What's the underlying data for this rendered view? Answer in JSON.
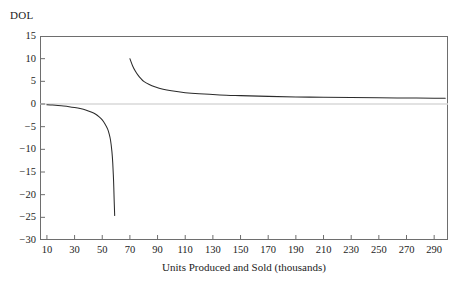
{
  "chart_data": {
    "type": "line",
    "title": "",
    "ylabel": "DOL",
    "xlabel": "Units Produced and Sold (thousands)",
    "xlim": [
      5,
      300
    ],
    "ylim": [
      -30,
      15
    ],
    "grid": false,
    "legend": "none",
    "zero_line": 0,
    "x_ticks": [
      10,
      30,
      50,
      70,
      90,
      110,
      130,
      150,
      170,
      190,
      210,
      230,
      250,
      270,
      290
    ],
    "y_ticks": [
      15,
      10,
      5,
      0,
      -5,
      -10,
      -15,
      -20,
      -25,
      -30
    ],
    "series": [
      {
        "name": "DOL below break-even",
        "comment": "left hyperbolic branch, negative, ends near -25",
        "x": [
          10,
          14,
          18,
          22,
          26,
          30,
          34,
          38,
          42,
          45,
          48,
          50,
          52,
          54,
          55,
          56,
          57,
          57.6,
          58.2,
          58.6,
          59
        ],
        "y": [
          -0.15,
          -0.24,
          -0.34,
          -0.46,
          -0.6,
          -0.78,
          -1.0,
          -1.3,
          -1.75,
          -2.2,
          -2.9,
          -3.5,
          -4.4,
          -5.6,
          -6.6,
          -8.0,
          -10.5,
          -13.0,
          -17.0,
          -21.0,
          -24.6
        ]
      },
      {
        "name": "DOL above break-even",
        "comment": "right hyperbolic branch, positive, starts near 10 and decays toward 1.2",
        "x": [
          70,
          72,
          74,
          76,
          78,
          80,
          84,
          88,
          94,
          100,
          110,
          120,
          135,
          150,
          170,
          190,
          210,
          230,
          250,
          270,
          290,
          298
        ],
        "y": [
          10.0,
          8.4,
          7.2,
          6.3,
          5.6,
          5.0,
          4.3,
          3.8,
          3.25,
          2.9,
          2.5,
          2.25,
          2.0,
          1.85,
          1.68,
          1.56,
          1.48,
          1.42,
          1.37,
          1.33,
          1.29,
          1.28
        ]
      }
    ],
    "colors": {
      "curve": "#2b2b2b",
      "frame": "#6e6e6e",
      "zero_line": "#d9d9d9",
      "background": "#ffffff",
      "text": "#1c1c1c"
    }
  }
}
